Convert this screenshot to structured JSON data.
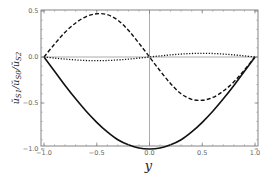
{
  "chart_data": {
    "type": "line",
    "title": "",
    "xlabel": "y",
    "ylabel": "ŭS1/ŭS0/ŭS2",
    "xlim": [
      -1.0,
      1.0
    ],
    "ylim": [
      -1.05,
      0.57
    ],
    "grid": false,
    "legend": null,
    "xticks": [
      -1.0,
      -0.5,
      0.0,
      0.5,
      1.0
    ],
    "xtick_labels": [
      "-1.0",
      "-0.5",
      "0.0",
      "0.5",
      "1.0"
    ],
    "yticks": [
      0.5,
      0.0,
      -0.5,
      -1.0
    ],
    "ytick_labels": [
      "0.5",
      "0.0",
      "-0.5",
      "-1.0"
    ],
    "reference_lines": [
      {
        "orientation": "horizontal",
        "value": 0.0
      },
      {
        "orientation": "vertical",
        "value": 0.0
      }
    ],
    "x": [
      -1.0,
      -0.9,
      -0.8,
      -0.7,
      -0.6,
      -0.5,
      -0.4,
      -0.3,
      -0.2,
      -0.1,
      0.0,
      0.1,
      0.2,
      0.3,
      0.4,
      0.5,
      0.6,
      0.7,
      0.8,
      0.9,
      1.0
    ],
    "series": [
      {
        "name": "solid",
        "style": "solid",
        "values": [
          0.0,
          -0.155,
          -0.31,
          -0.455,
          -0.59,
          -0.71,
          -0.815,
          -0.9,
          -0.955,
          -0.99,
          -1.0,
          -0.99,
          -0.955,
          -0.9,
          -0.815,
          -0.71,
          -0.59,
          -0.455,
          -0.31,
          -0.155,
          0.0
        ]
      },
      {
        "name": "dashed",
        "style": "dashed",
        "values": [
          0.0,
          0.14,
          0.27,
          0.37,
          0.44,
          0.47,
          0.46,
          0.4,
          0.29,
          0.15,
          0.0,
          -0.15,
          -0.29,
          -0.4,
          -0.46,
          -0.47,
          -0.44,
          -0.37,
          -0.27,
          -0.14,
          0.0
        ]
      },
      {
        "name": "dotted",
        "style": "dotted",
        "values": [
          0.0,
          -0.012,
          -0.023,
          -0.032,
          -0.038,
          -0.04,
          -0.038,
          -0.032,
          -0.023,
          -0.012,
          0.0,
          0.012,
          0.023,
          0.032,
          0.038,
          0.04,
          0.038,
          0.032,
          0.023,
          0.012,
          0.0
        ]
      }
    ]
  },
  "labels": {
    "xlabel": "y",
    "ylabel_main": "ŭ",
    "ylabel_parts": [
      "S1",
      "S0",
      "S2"
    ]
  }
}
